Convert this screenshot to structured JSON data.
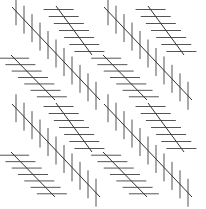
{
  "figure": {
    "background": "#ffffff",
    "line_color": "#333333",
    "hatch_color": "#555555",
    "tile_size": 92,
    "tiles": [
      {
        "dx": 0,
        "dy": 0
      },
      {
        "dx": 92,
        "dy": 0
      },
      {
        "dx": 0,
        "dy": 97
      },
      {
        "dx": 92,
        "dy": 97
      }
    ],
    "diagonals": [
      {
        "name": "main-diagonal",
        "x1": 12,
        "y1": 7,
        "x2": 100,
        "y2": 100,
        "hatch": "vertical",
        "hatch_len": 28,
        "hatch_count": 11
      },
      {
        "name": "upper-diagonal",
        "x1": 56,
        "y1": 6,
        "x2": 92,
        "y2": 55,
        "hatch": "horizontal",
        "hatch_len": 30,
        "hatch_count": 7
      },
      {
        "name": "lower-diagonal",
        "x1": 11,
        "y1": 55,
        "x2": 55,
        "y2": 100,
        "hatch": "horizontal",
        "hatch_len": 30,
        "hatch_count": 7
      }
    ]
  }
}
